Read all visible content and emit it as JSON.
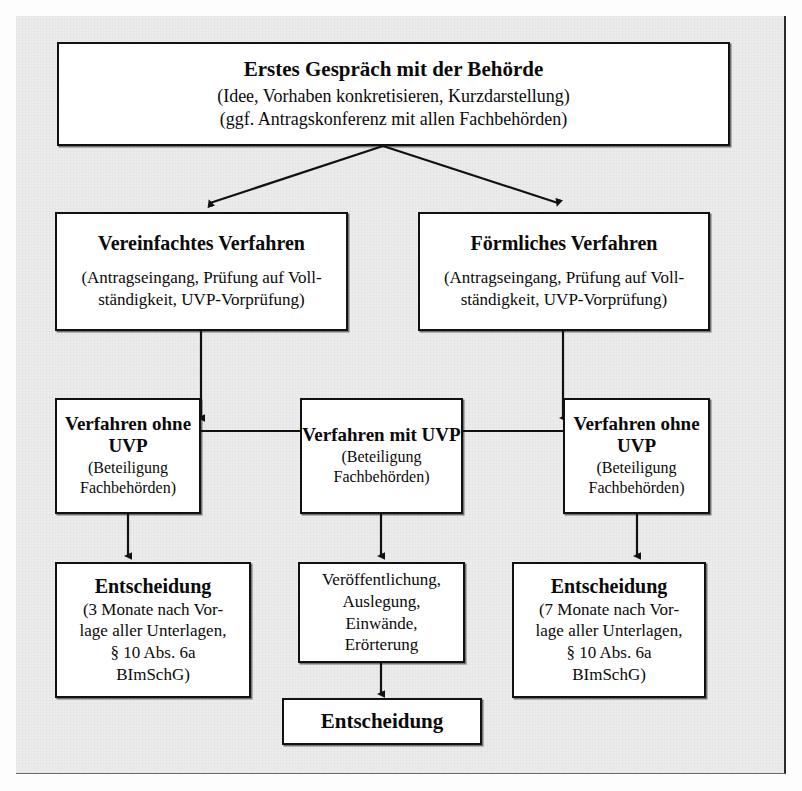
{
  "diagram": {
    "type": "flowchart",
    "language": "de",
    "background_color": "#ececec",
    "box_fill": "#ffffff",
    "line_color": "#111111",
    "nodes": [
      {
        "id": "erstes-gespraech",
        "title": "Erstes Gespräch mit der Behörde",
        "lines": [
          "(Idee, Vorhaben konkretisieren, Kurzdarstellung)",
          "(ggf. Antragskonferenz mit allen Fachbehörden)"
        ]
      },
      {
        "id": "vereinfachtes-verfahren",
        "title": "Vereinfachtes Verfahren",
        "lines": [
          "(Antragseingang, Prüfung auf Voll-",
          "ständigkeit, UVP-Vorprüfung)"
        ]
      },
      {
        "id": "foermliches-verfahren",
        "title": "Förmliches Verfahren",
        "lines": [
          "(Antragseingang, Prüfung auf Voll-",
          "ständigkeit, UVP-Vorprüfung)"
        ]
      },
      {
        "id": "verfahren-ohne-uvp-links",
        "title_lines": [
          "Verfahren",
          "ohne UVP"
        ],
        "lines": [
          "(Beteiligung",
          "Fachbehörden)"
        ]
      },
      {
        "id": "verfahren-mit-uvp",
        "title_lines": [
          "Verfahren",
          "mit UVP"
        ],
        "lines": [
          "(Beteiligung",
          "Fachbehörden)"
        ]
      },
      {
        "id": "verfahren-ohne-uvp-rechts",
        "title_lines": [
          "Verfahren",
          "ohne UVP"
        ],
        "lines": [
          "(Beteiligung",
          "Fachbehörden)"
        ]
      },
      {
        "id": "entscheidung-3-monate",
        "title": "Entscheidung",
        "lines": [
          "(3 Monate nach Vor-",
          "lage aller Unterlagen,",
          "§ 10 Abs. 6a",
          "BImSchG)"
        ]
      },
      {
        "id": "veroeffentlichung",
        "lines": [
          "Veröffentlichung,",
          "Auslegung,",
          "Einwände,",
          "Erörterung"
        ]
      },
      {
        "id": "entscheidung-7-monate",
        "title": "Entscheidung",
        "lines": [
          "(7 Monate nach Vor-",
          "lage aller Unterlagen,",
          "§ 10 Abs. 6a",
          "BImSchG)"
        ]
      },
      {
        "id": "entscheidung-final",
        "title": "Entscheidung",
        "lines": []
      }
    ]
  },
  "boxes": {
    "top": {
      "title": "Erstes Gespräch mit der Behörde",
      "line1": "(Idee, Vorhaben konkretisieren, Kurzdarstellung)",
      "line2": "(ggf. Antragskonferenz mit allen Fachbehörden)"
    },
    "simplified": {
      "title": "Vereinfachtes Verfahren",
      "line1": "(Antragseingang, Prüfung auf Voll-",
      "line2": "ständigkeit, UVP-Vorprüfung)"
    },
    "formal": {
      "title": "Förmliches Verfahren",
      "line1": "(Antragseingang, Prüfung auf Voll-",
      "line2": "ständigkeit, UVP-Vorprüfung)"
    },
    "no_uvp_left": {
      "title1": "Verfahren",
      "title2": "ohne UVP",
      "line1": "(Beteiligung",
      "line2": "Fachbehörden)"
    },
    "with_uvp": {
      "title1": "Verfahren",
      "title2": "mit UVP",
      "line1": "(Beteiligung",
      "line2": "Fachbehörden)"
    },
    "no_uvp_right": {
      "title1": "Verfahren",
      "title2": "ohne UVP",
      "line1": "(Beteiligung",
      "line2": "Fachbehörden)"
    },
    "decision_3": {
      "title": "Entscheidung",
      "line1": "(3 Monate nach Vor-",
      "line2": "lage aller Unterlagen,",
      "line3": "§ 10 Abs. 6a",
      "line4": "BImSchG)"
    },
    "publication": {
      "line1": "Veröffentlichung,",
      "line2": "Auslegung,",
      "line3": "Einwände,",
      "line4": "Erörterung"
    },
    "decision_7": {
      "title": "Entscheidung",
      "line1": "(7 Monate nach Vor-",
      "line2": "lage aller Unterlagen,",
      "line3": "§ 10 Abs. 6a",
      "line4": "BImSchG)"
    },
    "decision_final": {
      "title": "Entscheidung"
    }
  },
  "connectors": [
    {
      "id": "top-to-simplified",
      "from": "erstes-gespraech",
      "to": "vereinfachtes-verfahren",
      "style": "diagonal-arrow"
    },
    {
      "id": "top-to-formal",
      "from": "erstes-gespraech",
      "to": "foermliches-verfahren",
      "style": "diagonal-arrow"
    },
    {
      "id": "simplified-split",
      "from": "vereinfachtes-verfahren",
      "to": "verfahren-ohne-uvp-links",
      "style": "elbow-arrow"
    },
    {
      "id": "simplified-split-2",
      "from": "vereinfachtes-verfahren",
      "to": "verfahren-mit-uvp",
      "style": "elbow-arrow"
    },
    {
      "id": "formal-split",
      "from": "foermliches-verfahren",
      "to": "verfahren-mit-uvp",
      "style": "elbow-arrow"
    },
    {
      "id": "formal-split-2",
      "from": "foermliches-verfahren",
      "to": "verfahren-ohne-uvp-rechts",
      "style": "elbow-arrow"
    },
    {
      "id": "ohne-uvp-links-to-decision3",
      "from": "verfahren-ohne-uvp-links",
      "to": "entscheidung-3-monate",
      "style": "vertical-arrow"
    },
    {
      "id": "mit-uvp-to-publication",
      "from": "verfahren-mit-uvp",
      "to": "veroeffentlichung",
      "style": "vertical-arrow"
    },
    {
      "id": "ohne-uvp-rechts-to-decision7",
      "from": "verfahren-ohne-uvp-rechts",
      "to": "entscheidung-7-monate",
      "style": "vertical-arrow"
    },
    {
      "id": "publication-to-final",
      "from": "veroeffentlichung",
      "to": "entscheidung-final",
      "style": "vertical-arrow"
    }
  ]
}
